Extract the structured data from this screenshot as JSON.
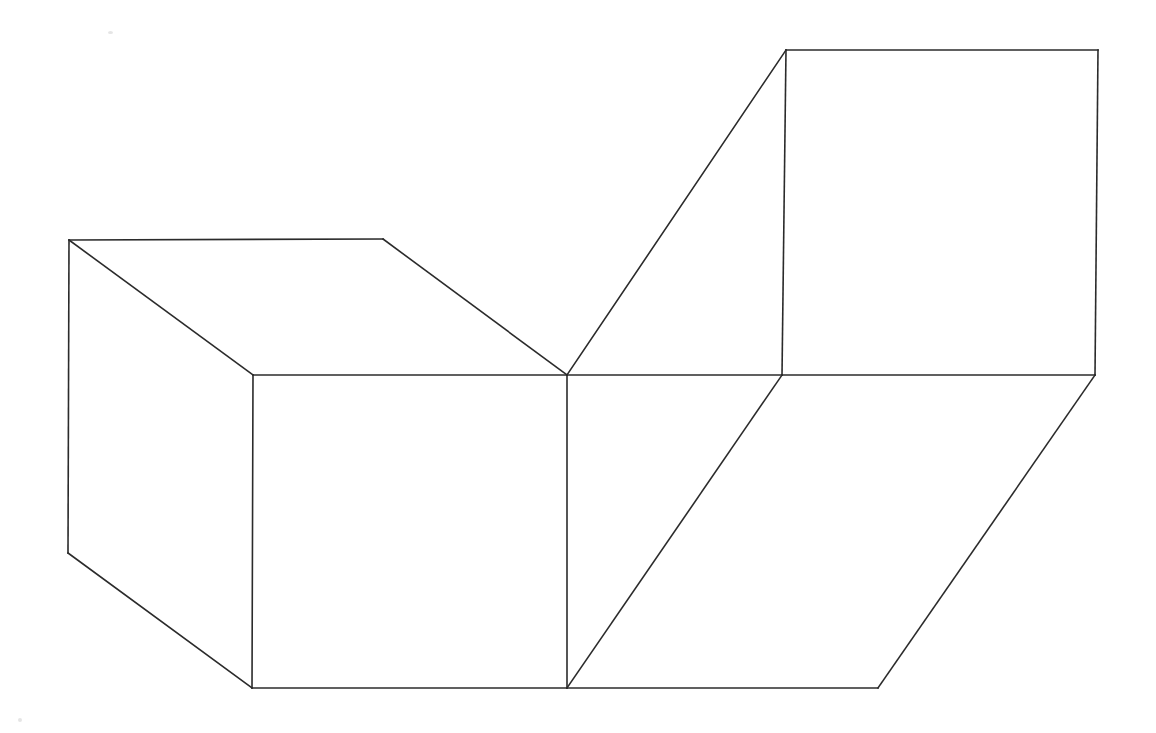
{
  "figure": {
    "title": "Isometric line drawing of two rectangular blocks joined by a slanted connector",
    "kind": "wireframe-line-drawing",
    "background_color": "#ffffff",
    "stroke_color": "#2b2b2b",
    "stroke_width": 1.6,
    "canvas": {
      "width": 1156,
      "height": 733
    },
    "vertices": {
      "left_top_back_left": [
        69,
        240
      ],
      "left_top_back_right": [
        383,
        239
      ],
      "left_top_front_right": [
        567,
        375
      ],
      "left_top_front_left": [
        253,
        375
      ],
      "left_bottom_left": [
        68,
        553
      ],
      "left_front_bottom_left": [
        252,
        688
      ],
      "left_front_bottom_right": [
        567,
        688
      ],
      "right_top_left": [
        786,
        50
      ],
      "right_top_right": [
        1098,
        50
      ],
      "right_face_bottom_left": [
        782,
        375
      ],
      "right_face_bottom_right": [
        1095,
        375
      ],
      "lower_front_bottom_right": [
        878,
        688
      ]
    },
    "faces": [
      {
        "name": "left-block-top-face",
        "points": "69,240 383,239 567,375 253,375"
      },
      {
        "name": "left-block-left-face",
        "points": "69,240 253,375 252,688 68,553"
      },
      {
        "name": "left-block-front-face",
        "points": "253,375 567,375 567,688 252,688"
      },
      {
        "name": "right-block-front-face",
        "points": "786,50 1098,50 1095,375 782,375"
      },
      {
        "name": "connector-lower-face",
        "points": "567,375 782,375 878,688 567,688"
      },
      {
        "name": "right-block-lower-face",
        "points": "782,375 1095,375 878,688"
      }
    ],
    "edges": [
      {
        "name": "left-top-back-edge",
        "points": "69,240 383,239"
      },
      {
        "name": "left-top-right-slant-edge",
        "points": "383,239 567,375"
      },
      {
        "name": "left-top-front-edge",
        "points": "253,375 567,375"
      },
      {
        "name": "left-top-left-slant-edge",
        "points": "69,240 253,375"
      },
      {
        "name": "left-back-vertical-edge",
        "points": "69,240 68,553"
      },
      {
        "name": "left-bottom-slant-edge",
        "points": "68,553 252,688"
      },
      {
        "name": "left-front-vertical-edge",
        "points": "253,375 252,688"
      },
      {
        "name": "left-front-bottom-edge",
        "points": "252,688 567,688"
      },
      {
        "name": "center-vertical-edge",
        "points": "567,375 567,688"
      },
      {
        "name": "connector-upper-slant-edge",
        "points": "567,375 786,50"
      },
      {
        "name": "right-top-edge",
        "points": "786,50 1098,50"
      },
      {
        "name": "right-left-vertical-edge",
        "points": "786,50 782,375"
      },
      {
        "name": "right-right-vertical-edge",
        "points": "1098,50 1095,375"
      },
      {
        "name": "right-face-bottom-edge",
        "points": "782,375 1095,375"
      },
      {
        "name": "connector-lower-slant-edge",
        "points": "567,375 782,375"
      },
      {
        "name": "lower-front-slant-edge",
        "points": "567,688 782,375"
      },
      {
        "name": "lower-bottom-edge",
        "points": "567,688 878,688"
      },
      {
        "name": "lower-right-slant-edge",
        "points": "878,688 1095,375"
      }
    ],
    "artifacts": [
      {
        "name": "scan-speck-top",
        "x": 108,
        "y": 31,
        "size": 5
      },
      {
        "name": "scan-speck-bottom",
        "x": 18,
        "y": 718,
        "size": 4
      }
    ]
  }
}
